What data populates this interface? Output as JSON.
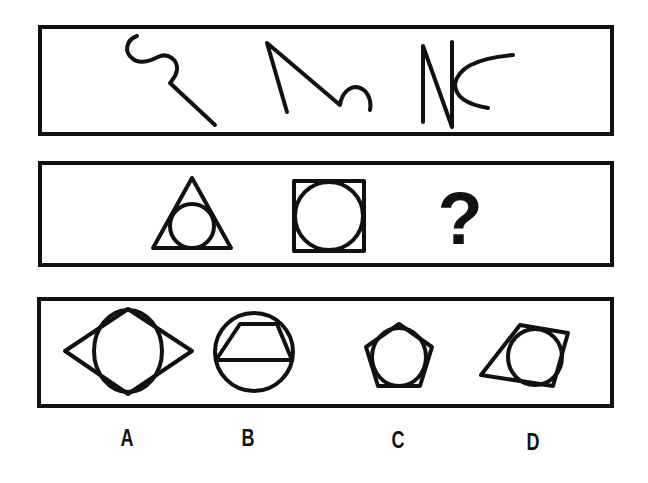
{
  "puzzle": {
    "row1": {
      "figures": [
        "hook-curve-with-line",
        "zigzag-with-arc",
        "n-shape-with-curve"
      ]
    },
    "row2": {
      "figures": [
        "circle-inscribed-in-triangle",
        "circle-inscribed-in-square"
      ],
      "unknown": "?"
    },
    "options": [
      {
        "label": "A",
        "figure": "circle-inscribed-in-rhombus"
      },
      {
        "label": "B",
        "figure": "trapezoid-inscribed-in-circle"
      },
      {
        "label": "C",
        "figure": "circle-inscribed-in-pentagon"
      },
      {
        "label": "D",
        "figure": "circle-in-irregular-quadrilateral"
      }
    ]
  },
  "colors": {
    "ink": "#111111",
    "background": "#ffffff"
  }
}
